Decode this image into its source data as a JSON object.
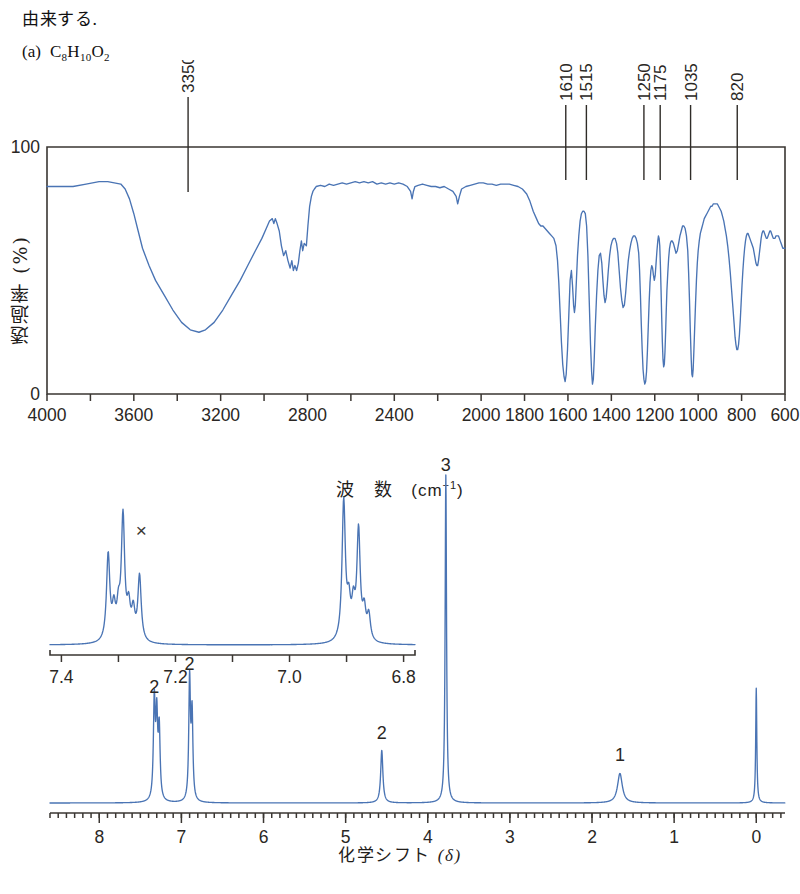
{
  "header": {
    "jp_line": "由来する.",
    "item_label": "(a)",
    "formula_parts": [
      {
        "t": "C",
        "sub": false
      },
      {
        "t": "8",
        "sub": true
      },
      {
        "t": "H",
        "sub": false
      },
      {
        "t": "10",
        "sub": true
      },
      {
        "t": "O",
        "sub": false
      },
      {
        "t": "2",
        "sub": true
      }
    ],
    "formula_plain": "C8H10O2"
  },
  "ir": {
    "y_axis_label": "透過率 (%)",
    "x_axis_label_main": "波　数",
    "x_axis_label_unit": "(cm-1)",
    "y_ticks": [
      "0",
      "100"
    ],
    "ylim": [
      0,
      100
    ],
    "xlim": [
      4000,
      600
    ],
    "x_tick_values": [
      4000,
      3800,
      3600,
      3400,
      3200,
      3000,
      2800,
      2600,
      2400,
      2200,
      2000,
      1800,
      1600,
      1400,
      1200,
      1000,
      800,
      600
    ],
    "x_tick_labels": [
      "4000",
      "3600",
      "3200",
      "2800",
      "2400",
      "2000",
      "1800",
      "1600",
      "1400",
      "1200",
      "1000",
      "800",
      "600"
    ],
    "x_labeled_values": [
      4000,
      3600,
      3200,
      2800,
      2400,
      2000,
      1800,
      1600,
      1400,
      1200,
      1000,
      800,
      600
    ],
    "peak_labels": [
      {
        "wavenumber": 3350,
        "text": "3350"
      },
      {
        "wavenumber": 1610,
        "text": "1610"
      },
      {
        "wavenumber": 1515,
        "text": "1515"
      },
      {
        "wavenumber": 1250,
        "text": "1250"
      },
      {
        "wavenumber": 1175,
        "text": "1175"
      },
      {
        "wavenumber": 1035,
        "text": "1035"
      },
      {
        "wavenumber": 820,
        "text": "820"
      }
    ],
    "trace_color": "#4a74b4",
    "trace": [
      [
        4000,
        84
      ],
      [
        3940,
        84
      ],
      [
        3880,
        84
      ],
      [
        3820,
        85
      ],
      [
        3760,
        86
      ],
      [
        3720,
        86
      ],
      [
        3690,
        85.5
      ],
      [
        3660,
        85
      ],
      [
        3640,
        83
      ],
      [
        3620,
        79
      ],
      [
        3600,
        73
      ],
      [
        3580,
        66
      ],
      [
        3560,
        59
      ],
      [
        3530,
        52
      ],
      [
        3500,
        46
      ],
      [
        3460,
        40
      ],
      [
        3420,
        34
      ],
      [
        3380,
        29
      ],
      [
        3340,
        26
      ],
      [
        3300,
        25
      ],
      [
        3270,
        26
      ],
      [
        3230,
        29
      ],
      [
        3190,
        34
      ],
      [
        3150,
        40
      ],
      [
        3110,
        46
      ],
      [
        3075,
        52
      ],
      [
        3040,
        58
      ],
      [
        3010,
        63
      ],
      [
        2990,
        67
      ],
      [
        2975,
        70
      ],
      [
        2962,
        71
      ],
      [
        2955,
        69
      ],
      [
        2948,
        71
      ],
      [
        2940,
        69
      ],
      [
        2930,
        66
      ],
      [
        2920,
        60
      ],
      [
        2910,
        56
      ],
      [
        2900,
        58
      ],
      [
        2890,
        54
      ],
      [
        2880,
        51
      ],
      [
        2872,
        54
      ],
      [
        2865,
        50
      ],
      [
        2858,
        52
      ],
      [
        2850,
        50
      ],
      [
        2842,
        53
      ],
      [
        2835,
        58
      ],
      [
        2828,
        62
      ],
      [
        2822,
        58
      ],
      [
        2815,
        61
      ],
      [
        2805,
        60
      ],
      [
        2798,
        68
      ],
      [
        2790,
        76
      ],
      [
        2782,
        80
      ],
      [
        2775,
        82
      ],
      [
        2768,
        83
      ],
      [
        2760,
        84
      ],
      [
        2740,
        84.5
      ],
      [
        2720,
        84
      ],
      [
        2700,
        85
      ],
      [
        2680,
        84.5
      ],
      [
        2660,
        85
      ],
      [
        2640,
        85.5
      ],
      [
        2620,
        85
      ],
      [
        2600,
        85.5
      ],
      [
        2580,
        86
      ],
      [
        2560,
        85.5
      ],
      [
        2540,
        86
      ],
      [
        2520,
        85.5
      ],
      [
        2500,
        86
      ],
      [
        2480,
        85
      ],
      [
        2460,
        85.5
      ],
      [
        2440,
        85
      ],
      [
        2420,
        85.5
      ],
      [
        2400,
        85
      ],
      [
        2380,
        85.5
      ],
      [
        2360,
        85
      ],
      [
        2340,
        84
      ],
      [
        2325,
        82
      ],
      [
        2318,
        79
      ],
      [
        2312,
        82
      ],
      [
        2305,
        84
      ],
      [
        2290,
        84.5
      ],
      [
        2270,
        85
      ],
      [
        2250,
        84.5
      ],
      [
        2230,
        84
      ],
      [
        2210,
        84
      ],
      [
        2190,
        83.5
      ],
      [
        2170,
        84
      ],
      [
        2150,
        83
      ],
      [
        2130,
        82
      ],
      [
        2115,
        80
      ],
      [
        2108,
        77
      ],
      [
        2100,
        80
      ],
      [
        2090,
        83
      ],
      [
        2070,
        84
      ],
      [
        2050,
        84.5
      ],
      [
        2030,
        85
      ],
      [
        2010,
        85.5
      ],
      [
        1990,
        85.5
      ],
      [
        1970,
        85
      ],
      [
        1950,
        85
      ],
      [
        1930,
        84.5
      ],
      [
        1910,
        85
      ],
      [
        1890,
        85
      ],
      [
        1870,
        85
      ],
      [
        1850,
        84.5
      ],
      [
        1830,
        84
      ],
      [
        1810,
        83
      ],
      [
        1790,
        81
      ],
      [
        1775,
        78
      ],
      [
        1760,
        74
      ],
      [
        1745,
        71
      ],
      [
        1735,
        69
      ],
      [
        1725,
        68
      ],
      [
        1715,
        68
      ],
      [
        1705,
        67
      ],
      [
        1695,
        66
      ],
      [
        1685,
        65
      ],
      [
        1675,
        64
      ],
      [
        1665,
        63
      ],
      [
        1655,
        60
      ],
      [
        1648,
        54
      ],
      [
        1642,
        45
      ],
      [
        1636,
        33
      ],
      [
        1630,
        21
      ],
      [
        1624,
        12
      ],
      [
        1618,
        7
      ],
      [
        1613,
        5
      ],
      [
        1608,
        8
      ],
      [
        1602,
        18
      ],
      [
        1596,
        32
      ],
      [
        1590,
        46
      ],
      [
        1584,
        50
      ],
      [
        1579,
        44
      ],
      [
        1574,
        36
      ],
      [
        1570,
        33
      ],
      [
        1566,
        36
      ],
      [
        1561,
        46
      ],
      [
        1556,
        56
      ],
      [
        1550,
        64
      ],
      [
        1544,
        70
      ],
      [
        1538,
        73
      ],
      [
        1532,
        74
      ],
      [
        1526,
        74
      ],
      [
        1520,
        73
      ],
      [
        1514,
        68
      ],
      [
        1508,
        56
      ],
      [
        1502,
        38
      ],
      [
        1496,
        20
      ],
      [
        1491,
        9
      ],
      [
        1487,
        4
      ],
      [
        1483,
        6
      ],
      [
        1479,
        14
      ],
      [
        1474,
        27
      ],
      [
        1468,
        40
      ],
      [
        1462,
        50
      ],
      [
        1456,
        56
      ],
      [
        1450,
        57
      ],
      [
        1444,
        53
      ],
      [
        1439,
        46
      ],
      [
        1434,
        40
      ],
      [
        1429,
        37
      ],
      [
        1424,
        39
      ],
      [
        1419,
        44
      ],
      [
        1414,
        50
      ],
      [
        1408,
        56
      ],
      [
        1402,
        60
      ],
      [
        1396,
        62
      ],
      [
        1390,
        63
      ],
      [
        1383,
        63
      ],
      [
        1376,
        61
      ],
      [
        1370,
        57
      ],
      [
        1364,
        50
      ],
      [
        1358,
        43
      ],
      [
        1352,
        38
      ],
      [
        1346,
        35
      ],
      [
        1340,
        36
      ],
      [
        1334,
        41
      ],
      [
        1328,
        48
      ],
      [
        1322,
        54
      ],
      [
        1316,
        58
      ],
      [
        1310,
        61
      ],
      [
        1304,
        63
      ],
      [
        1298,
        64
      ],
      [
        1292,
        64
      ],
      [
        1286,
        63
      ],
      [
        1280,
        61
      ],
      [
        1274,
        57
      ],
      [
        1270,
        50
      ],
      [
        1266,
        40
      ],
      [
        1262,
        28
      ],
      [
        1258,
        18
      ],
      [
        1254,
        10
      ],
      [
        1250,
        6
      ],
      [
        1246,
        4
      ],
      [
        1242,
        5
      ],
      [
        1238,
        9
      ],
      [
        1234,
        17
      ],
      [
        1230,
        27
      ],
      [
        1226,
        37
      ],
      [
        1222,
        45
      ],
      [
        1218,
        50
      ],
      [
        1214,
        52
      ],
      [
        1210,
        51
      ],
      [
        1206,
        48
      ],
      [
        1202,
        46
      ],
      [
        1198,
        48
      ],
      [
        1194,
        53
      ],
      [
        1190,
        58
      ],
      [
        1186,
        62
      ],
      [
        1183,
        64
      ],
      [
        1180,
        63
      ],
      [
        1177,
        60
      ],
      [
        1174,
        52
      ],
      [
        1171,
        42
      ],
      [
        1168,
        31
      ],
      [
        1165,
        21
      ],
      [
        1162,
        14
      ],
      [
        1159,
        11
      ],
      [
        1156,
        12
      ],
      [
        1153,
        17
      ],
      [
        1150,
        25
      ],
      [
        1147,
        34
      ],
      [
        1144,
        42
      ],
      [
        1140,
        49
      ],
      [
        1136,
        55
      ],
      [
        1132,
        59
      ],
      [
        1128,
        61
      ],
      [
        1124,
        62
      ],
      [
        1120,
        62
      ],
      [
        1114,
        61
      ],
      [
        1108,
        59
      ],
      [
        1102,
        57
      ],
      [
        1096,
        58
      ],
      [
        1090,
        61
      ],
      [
        1084,
        64
      ],
      [
        1078,
        66
      ],
      [
        1072,
        68
      ],
      [
        1066,
        68
      ],
      [
        1060,
        67
      ],
      [
        1054,
        64
      ],
      [
        1048,
        58
      ],
      [
        1044,
        49
      ],
      [
        1040,
        38
      ],
      [
        1036,
        25
      ],
      [
        1032,
        14
      ],
      [
        1029,
        8
      ],
      [
        1026,
        7
      ],
      [
        1023,
        10
      ],
      [
        1020,
        17
      ],
      [
        1016,
        27
      ],
      [
        1012,
        37
      ],
      [
        1008,
        46
      ],
      [
        1004,
        53
      ],
      [
        1000,
        58
      ],
      [
        995,
        62
      ],
      [
        990,
        65
      ],
      [
        984,
        67
      ],
      [
        978,
        69
      ],
      [
        972,
        71
      ],
      [
        966,
        72
      ],
      [
        960,
        73
      ],
      [
        954,
        74
      ],
      [
        948,
        75
      ],
      [
        942,
        76
      ],
      [
        936,
        76
      ],
      [
        930,
        77
      ],
      [
        924,
        77
      ],
      [
        918,
        77
      ],
      [
        912,
        77
      ],
      [
        906,
        76
      ],
      [
        900,
        75
      ],
      [
        894,
        74
      ],
      [
        888,
        72
      ],
      [
        882,
        70
      ],
      [
        876,
        67
      ],
      [
        870,
        64
      ],
      [
        864,
        60
      ],
      [
        858,
        55
      ],
      [
        852,
        49
      ],
      [
        846,
        42
      ],
      [
        840,
        35
      ],
      [
        834,
        28
      ],
      [
        830,
        23
      ],
      [
        826,
        20
      ],
      [
        822,
        18
      ],
      [
        818,
        18
      ],
      [
        814,
        20
      ],
      [
        810,
        24
      ],
      [
        806,
        30
      ],
      [
        802,
        37
      ],
      [
        798,
        44
      ],
      [
        794,
        50
      ],
      [
        790,
        55
      ],
      [
        786,
        59
      ],
      [
        782,
        62
      ],
      [
        778,
        64
      ],
      [
        774,
        65
      ],
      [
        770,
        65
      ],
      [
        766,
        64
      ],
      [
        762,
        63
      ],
      [
        758,
        62
      ],
      [
        754,
        61
      ],
      [
        750,
        60
      ],
      [
        746,
        59
      ],
      [
        742,
        57
      ],
      [
        738,
        55
      ],
      [
        734,
        53
      ],
      [
        730,
        52
      ],
      [
        726,
        52
      ],
      [
        722,
        54
      ],
      [
        718,
        57
      ],
      [
        714,
        60
      ],
      [
        710,
        63
      ],
      [
        706,
        65
      ],
      [
        702,
        66
      ],
      [
        698,
        66
      ],
      [
        694,
        65
      ],
      [
        690,
        64
      ],
      [
        686,
        63
      ],
      [
        682,
        63
      ],
      [
        678,
        64
      ],
      [
        674,
        65
      ],
      [
        670,
        66
      ],
      [
        666,
        66
      ],
      [
        662,
        65
      ],
      [
        658,
        64
      ],
      [
        654,
        63
      ],
      [
        650,
        63
      ],
      [
        646,
        63
      ],
      [
        642,
        64
      ],
      [
        638,
        64
      ],
      [
        634,
        64
      ],
      [
        630,
        64
      ],
      [
        626,
        63
      ],
      [
        622,
        62
      ],
      [
        618,
        61
      ],
      [
        614,
        60
      ],
      [
        610,
        59
      ],
      [
        606,
        59
      ],
      [
        602,
        59
      ],
      [
        600,
        59
      ]
    ]
  },
  "nmr": {
    "x_axis_label_main": "化学シフト",
    "x_axis_label_delta": "(δ)",
    "trace_color": "#4a74b4",
    "main": {
      "xlim": [
        8.6,
        -0.35
      ],
      "major_ticks": [
        8,
        7,
        6,
        5,
        4,
        3,
        2,
        1,
        0
      ],
      "major_tick_labels": [
        "8",
        "7",
        "6",
        "5",
        "4",
        "3",
        "2",
        "1",
        "0"
      ],
      "minor_tick_step": 0.1,
      "peaks": [
        {
          "shift": 7.33,
          "height": 0.3,
          "width": 0.013,
          "label": "2"
        },
        {
          "shift": 7.3,
          "height": 0.24,
          "width": 0.013,
          "label": null
        },
        {
          "shift": 7.27,
          "height": 0.21,
          "width": 0.013,
          "label": null
        },
        {
          "shift": 6.9,
          "height": 0.37,
          "width": 0.012,
          "label": "2"
        },
        {
          "shift": 6.87,
          "height": 0.26,
          "width": 0.012,
          "label": null
        },
        {
          "shift": 4.56,
          "height": 0.16,
          "width": 0.016,
          "label": "2"
        },
        {
          "shift": 3.78,
          "height": 1.0,
          "width": 0.01,
          "label": "3"
        },
        {
          "shift": 1.66,
          "height": 0.09,
          "width": 0.035,
          "label": "1"
        },
        {
          "shift": 0.0,
          "height": 0.35,
          "width": 0.008,
          "label": null
        }
      ]
    },
    "inset": {
      "xlim": [
        7.42,
        6.78
      ],
      "tick_values": [
        7.4,
        7.3,
        7.2,
        7.1,
        7.0,
        6.9,
        6.8
      ],
      "tick_labels": [
        {
          "value": 7.4,
          "text": "7.4"
        },
        {
          "value": 7.3,
          "text": ""
        },
        {
          "value": 7.2,
          "text": "7.2"
        },
        {
          "value": 7.1,
          "text": ""
        },
        {
          "value": 7.0,
          "text": "7.0"
        },
        {
          "value": 6.9,
          "text": ""
        },
        {
          "value": 6.8,
          "text": "6.8"
        }
      ],
      "solvent_marker": {
        "symbol": "×",
        "shift": 7.265,
        "name": "chloroform-residual"
      },
      "peaks": [
        {
          "shift": 7.318,
          "height": 0.62
        },
        {
          "shift": 7.308,
          "height": 0.21
        },
        {
          "shift": 7.3,
          "height": 0.2
        },
        {
          "shift": 7.292,
          "height": 0.88
        },
        {
          "shift": 7.282,
          "height": 0.22
        },
        {
          "shift": 7.274,
          "height": 0.2
        },
        {
          "shift": 7.263,
          "height": 0.47
        },
        {
          "shift": 6.905,
          "height": 1.0
        },
        {
          "shift": 6.896,
          "height": 0.24
        },
        {
          "shift": 6.888,
          "height": 0.23
        },
        {
          "shift": 6.879,
          "height": 0.78
        },
        {
          "shift": 6.869,
          "height": 0.2
        },
        {
          "shift": 6.861,
          "height": 0.18
        }
      ]
    }
  }
}
